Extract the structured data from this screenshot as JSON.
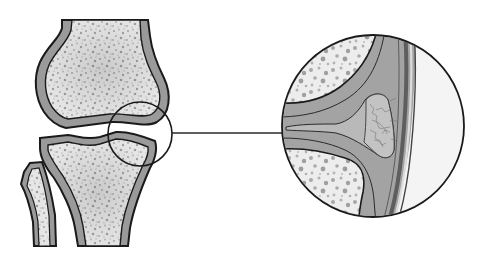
{
  "diagram": {
    "title": "Knee joint with magnified view of joint space",
    "type": "anatomical-illustration",
    "colors": {
      "background": "#ffffff",
      "outline": "#1a1a1a",
      "cortex": "#9a9a9a",
      "marrow_base": "#e4e4e4",
      "marrow_speckle": "#a8a8a8",
      "cartilage": "#8f8f8f",
      "joint_fluid": "#b7b7b7",
      "synovium": "#c8c8c8",
      "capsule_stripe": "#6e6e6e"
    },
    "parts": [
      {
        "id": "femur",
        "label": "Femur"
      },
      {
        "id": "tibia",
        "label": "Tibia"
      },
      {
        "id": "fibula",
        "label": "Fibula"
      },
      {
        "id": "detail-circle-small",
        "label": "Selected joint region"
      },
      {
        "id": "detail-circle-large",
        "label": "Magnified joint region"
      },
      {
        "id": "leader-line",
        "label": "Connector"
      }
    ],
    "zoom_circle_small": {
      "cx": 140,
      "cy": 134,
      "r": 32
    },
    "zoom_circle_large": {
      "cx": 373,
      "cy": 126,
      "r": 91
    },
    "leader_line": {
      "x1": 172,
      "y1": 133,
      "x2": 283,
      "y2": 133
    }
  }
}
